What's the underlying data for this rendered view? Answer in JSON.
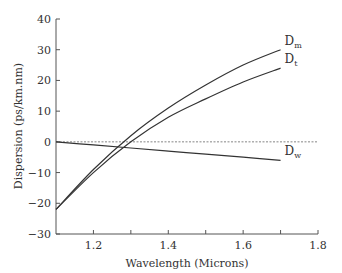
{
  "chart_data": {
    "type": "line",
    "title": "",
    "xlabel": "Wavelength (Microns)",
    "ylabel": "Dispersion (ps/km.nm)",
    "xlim": [
      1.1,
      1.8
    ],
    "ylim": [
      -30,
      40
    ],
    "xticks": [
      1.2,
      1.4,
      1.6,
      1.8
    ],
    "xminor": [
      1.3,
      1.5,
      1.7
    ],
    "yticks": [
      -30,
      -20,
      -10,
      0,
      10,
      20,
      30,
      40
    ],
    "grid": false,
    "reference_line": {
      "y": 0,
      "style": "dashed"
    },
    "series": [
      {
        "name": "Dm",
        "label_main": "D",
        "label_sub": "m",
        "x": [
          1.1,
          1.2,
          1.3,
          1.4,
          1.5,
          1.6,
          1.7
        ],
        "y": [
          -22,
          -9,
          2,
          11,
          18.5,
          25,
          30
        ]
      },
      {
        "name": "Dt",
        "label_main": "D",
        "label_sub": "t",
        "x": [
          1.1,
          1.2,
          1.3,
          1.4,
          1.5,
          1.6,
          1.7
        ],
        "y": [
          -22,
          -10,
          0,
          8,
          14,
          19.5,
          24
        ]
      },
      {
        "name": "Dw",
        "label_main": "D",
        "label_sub": "w",
        "x": [
          1.1,
          1.2,
          1.3,
          1.4,
          1.5,
          1.6,
          1.7
        ],
        "y": [
          0,
          -1,
          -2,
          -3,
          -4,
          -5,
          -6
        ]
      }
    ]
  }
}
